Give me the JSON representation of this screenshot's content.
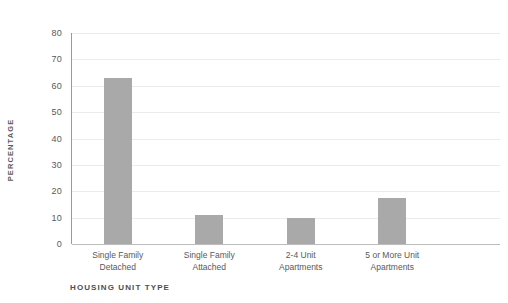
{
  "chart_data": {
    "type": "bar",
    "title": "",
    "subtitle": "",
    "xlabel": "HOUSING UNIT TYPE",
    "ylabel": "PERCENTAGE",
    "categories": [
      "Single Family Detached",
      "Single Family Attached",
      "2-4 Unit Apartments",
      "5 or More Unit Apartments"
    ],
    "category_lines": [
      [
        "Single Family",
        "Detached"
      ],
      [
        "Single Family",
        "Attached"
      ],
      [
        "2-4 Unit",
        "Apartments"
      ],
      [
        "5 or More Unit",
        "Apartments"
      ]
    ],
    "values": [
      63,
      11,
      10,
      17.5
    ],
    "ylim": [
      0,
      80
    ],
    "ytick_step": 10,
    "yticks": [
      80,
      70,
      60,
      50,
      40,
      30,
      20,
      10,
      0
    ],
    "ytick_labels": [
      "80",
      "70",
      "60",
      "50",
      "40",
      "30",
      "20",
      "10",
      "0"
    ],
    "grid": true,
    "legend": false,
    "legend_position": "none",
    "bar_color": "#a9a9a9",
    "gridline_color": "#ececec",
    "axis_color": "#9a9a9a",
    "text_color": "#58595b",
    "background": "#ffffff"
  }
}
